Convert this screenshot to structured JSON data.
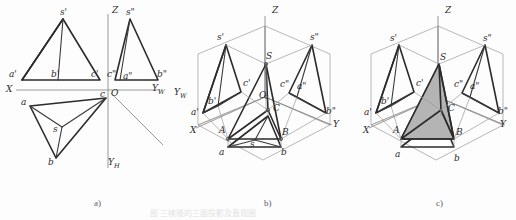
{
  "figure": {
    "title_ghost": "图 三棱锥的三面投影及直观图",
    "panels": [
      {
        "id": "a",
        "caption": "a)",
        "x": 94,
        "y": 198
      },
      {
        "id": "b",
        "caption": "b)",
        "x": 264,
        "y": 198
      },
      {
        "id": "c",
        "caption": "c)",
        "x": 436,
        "y": 198
      }
    ],
    "colors": {
      "line": "#2b2b2b",
      "thin_line": "#8d8d8d",
      "axis": "#8d8d8d",
      "shade_fill": "#b4b4b4",
      "background": "#fdfdfd",
      "caption": "#5a5a6a"
    }
  },
  "panel_a": {
    "name": "three-view-projection",
    "axes": [
      {
        "label": "X",
        "x": 6,
        "y": 92
      },
      {
        "label": "Z",
        "x": 112,
        "y": 8
      },
      {
        "label": "O",
        "x": 110,
        "y": 90
      },
      {
        "label": "Y",
        "sub": "W",
        "x": 156,
        "y": 92
      },
      {
        "label": "Y",
        "sub": "H",
        "x": 110,
        "y": 163
      }
    ],
    "front_view": {
      "name": "v-projection",
      "labels": [
        {
          "text": "s'",
          "x": 60,
          "y": 12
        },
        {
          "text": "a'",
          "x": 9,
          "y": 73
        },
        {
          "text": "b'",
          "x": 54,
          "y": 73
        },
        {
          "text": "c'",
          "x": 92,
          "y": 73
        }
      ]
    },
    "side_view": {
      "name": "w-projection",
      "labels": [
        {
          "text": "s\"",
          "x": 126,
          "y": 12
        },
        {
          "text": "c\"",
          "x": 108,
          "y": 73
        },
        {
          "text": "a\"",
          "x": 124,
          "y": 75
        },
        {
          "text": "b\"",
          "x": 160,
          "y": 73
        }
      ]
    },
    "top_view": {
      "name": "h-projection",
      "labels": [
        {
          "text": "a",
          "x": 22,
          "y": 110
        },
        {
          "text": "b",
          "x": 47,
          "y": 163
        },
        {
          "text": "c",
          "x": 98,
          "y": 99
        },
        {
          "text": "s",
          "x": 52,
          "y": 131
        }
      ]
    }
  },
  "panel_b": {
    "name": "pictorial-wireframe",
    "axes": [
      {
        "label": "Z",
        "x": 272,
        "y": 9
      },
      {
        "label": "X",
        "x": 192,
        "y": 131
      },
      {
        "label": "Y",
        "x": 333,
        "y": 127
      },
      {
        "label": "Y",
        "sub": "W",
        "x": 177,
        "y": 95
      },
      {
        "label": "O",
        "x": 265,
        "y": 98
      }
    ],
    "labels": [
      {
        "text": "s'",
        "x": 218,
        "y": 37
      },
      {
        "text": "s\"",
        "x": 310,
        "y": 37
      },
      {
        "text": "S",
        "x": 266,
        "y": 56
      },
      {
        "text": "c'",
        "x": 245,
        "y": 83
      },
      {
        "text": "c\"",
        "x": 281,
        "y": 84
      },
      {
        "text": "a\"",
        "x": 298,
        "y": 86
      },
      {
        "text": "b'",
        "x": 210,
        "y": 101
      },
      {
        "text": "a'",
        "x": 193,
        "y": 113
      },
      {
        "text": "b\"",
        "x": 327,
        "y": 112
      },
      {
        "text": "C",
        "x": 274,
        "y": 112
      },
      {
        "text": "A",
        "x": 220,
        "y": 131
      },
      {
        "text": "B",
        "x": 282,
        "y": 134
      },
      {
        "text": "a",
        "x": 220,
        "y": 153
      },
      {
        "text": "b",
        "x": 281,
        "y": 153
      },
      {
        "text": "s",
        "x": 250,
        "y": 145
      }
    ]
  },
  "panel_c": {
    "name": "pictorial-solid-shaded",
    "axes": [
      {
        "label": "Z",
        "x": 445,
        "y": 9
      },
      {
        "label": "X",
        "x": 365,
        "y": 131
      },
      {
        "label": "Y",
        "x": 500,
        "y": 127
      }
    ],
    "labels": [
      {
        "text": "s'",
        "x": 392,
        "y": 38
      },
      {
        "text": "s\"",
        "x": 483,
        "y": 38
      },
      {
        "text": "S",
        "x": 440,
        "y": 57
      },
      {
        "text": "c'",
        "x": 418,
        "y": 83
      },
      {
        "text": "c\"",
        "x": 455,
        "y": 84
      },
      {
        "text": "a\"",
        "x": 471,
        "y": 86
      },
      {
        "text": "b'",
        "x": 383,
        "y": 101
      },
      {
        "text": "a'",
        "x": 366,
        "y": 113
      },
      {
        "text": "b\"",
        "x": 499,
        "y": 112
      },
      {
        "text": "C",
        "x": 449,
        "y": 112
      },
      {
        "text": "A",
        "x": 394,
        "y": 131
      },
      {
        "text": "B",
        "x": 456,
        "y": 134
      },
      {
        "text": "a",
        "x": 396,
        "y": 155
      },
      {
        "text": "b",
        "x": 455,
        "y": 159
      }
    ]
  }
}
